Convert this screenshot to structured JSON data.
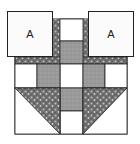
{
  "diagram": {
    "type": "quilt-block",
    "colors": {
      "white": "#ffffff",
      "gray": "#9a9a9a",
      "dark_print": "#6e6e6e",
      "outline": "#222222",
      "label_square_bg": "#fbfbfb"
    },
    "labels": {
      "left_square": "A",
      "right_square": "A"
    }
  }
}
